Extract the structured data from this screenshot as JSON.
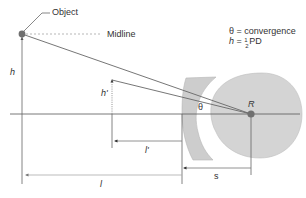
{
  "diagram": {
    "labels": {
      "object": "Object",
      "midline": "Midline",
      "h": "h",
      "h_prime": "h'",
      "l": "l",
      "l_prime": "l'",
      "s": "s",
      "R": "R",
      "theta": "θ"
    },
    "legend": {
      "line1": "θ = convergence",
      "line2_prefix": "h",
      "line2_eq": " = ",
      "line2_frac_num": "1",
      "line2_frac_den": "2",
      "line2_suffix": "PD"
    },
    "colors": {
      "line": "#666666",
      "lens_fill": "#cfcfcf",
      "eye_fill": "#d4d4d4",
      "dot": "#707070",
      "dashed": "#9a9a9a"
    }
  }
}
